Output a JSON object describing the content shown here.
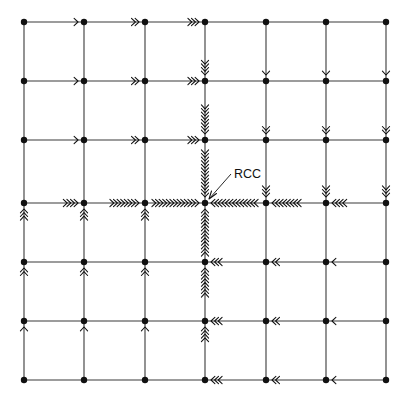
{
  "figure": {
    "title": "",
    "kind": "flow-net-diagram",
    "background_color": "#ffffff",
    "line_color": "#3a3a3a",
    "node_color": "#111111",
    "arrow_color": "#111111"
  },
  "labels": {
    "center_label": "RCC",
    "center_label_x": 234,
    "center_label_y": 178
  },
  "chart_data": {
    "type": "diagram",
    "title": "",
    "xlabel": "",
    "ylabel": "",
    "grid": {
      "columns": 7,
      "rows": 7,
      "x_positions": [
        24,
        84,
        145,
        205,
        266,
        326,
        386
      ],
      "y_positions": [
        22,
        81,
        140,
        203,
        262,
        321,
        380
      ],
      "cell_width": 60.3,
      "cell_height": 59.7,
      "node_radius": 3.2
    },
    "center_node": {
      "col": 3,
      "row": 3,
      "x": 205,
      "y": 203,
      "label": "RCC"
    },
    "horizontal_flows": [
      {
        "row": 0,
        "segment": 0,
        "direction": "right",
        "chevrons": 1
      },
      {
        "row": 0,
        "segment": 1,
        "direction": "right",
        "chevrons": 2
      },
      {
        "row": 0,
        "segment": 2,
        "direction": "right",
        "chevrons": 3
      },
      {
        "row": 1,
        "segment": 0,
        "direction": "right",
        "chevrons": 1
      },
      {
        "row": 1,
        "segment": 1,
        "direction": "right",
        "chevrons": 2
      },
      {
        "row": 1,
        "segment": 2,
        "direction": "right",
        "chevrons": 3
      },
      {
        "row": 2,
        "segment": 0,
        "direction": "right",
        "chevrons": 1
      },
      {
        "row": 2,
        "segment": 1,
        "direction": "right",
        "chevrons": 2
      },
      {
        "row": 2,
        "segment": 2,
        "direction": "right",
        "chevrons": 3
      },
      {
        "row": 3,
        "segment": 0,
        "direction": "right",
        "chevrons": 4
      },
      {
        "row": 3,
        "segment": 1,
        "direction": "right",
        "chevrons": 8
      },
      {
        "row": 3,
        "segment": 2,
        "direction": "right",
        "chevrons": 13
      },
      {
        "row": 3,
        "segment": 3,
        "direction": "left",
        "chevrons": 13
      },
      {
        "row": 3,
        "segment": 4,
        "direction": "left",
        "chevrons": 8
      },
      {
        "row": 3,
        "segment": 5,
        "direction": "left",
        "chevrons": 4
      },
      {
        "row": 4,
        "segment": 3,
        "direction": "left",
        "chevrons": 3
      },
      {
        "row": 4,
        "segment": 4,
        "direction": "left",
        "chevrons": 2
      },
      {
        "row": 4,
        "segment": 5,
        "direction": "left",
        "chevrons": 1
      },
      {
        "row": 5,
        "segment": 3,
        "direction": "left",
        "chevrons": 3
      },
      {
        "row": 5,
        "segment": 4,
        "direction": "left",
        "chevrons": 2
      },
      {
        "row": 5,
        "segment": 5,
        "direction": "left",
        "chevrons": 1
      },
      {
        "row": 6,
        "segment": 3,
        "direction": "left",
        "chevrons": 3
      },
      {
        "row": 6,
        "segment": 4,
        "direction": "left",
        "chevrons": 2
      },
      {
        "row": 6,
        "segment": 5,
        "direction": "left",
        "chevrons": 1
      }
    ],
    "vertical_flows": [
      {
        "col": 3,
        "segment": 0,
        "direction": "down",
        "chevrons": 4
      },
      {
        "col": 3,
        "segment": 1,
        "direction": "down",
        "chevrons": 8
      },
      {
        "col": 3,
        "segment": 2,
        "direction": "down",
        "chevrons": 13
      },
      {
        "col": 3,
        "segment": 3,
        "direction": "up",
        "chevrons": 13
      },
      {
        "col": 3,
        "segment": 4,
        "direction": "up",
        "chevrons": 8
      },
      {
        "col": 3,
        "segment": 5,
        "direction": "up",
        "chevrons": 4
      },
      {
        "col": 4,
        "segment": 0,
        "direction": "down",
        "chevrons": 1
      },
      {
        "col": 4,
        "segment": 1,
        "direction": "down",
        "chevrons": 2
      },
      {
        "col": 4,
        "segment": 2,
        "direction": "down",
        "chevrons": 3
      },
      {
        "col": 5,
        "segment": 0,
        "direction": "down",
        "chevrons": 1
      },
      {
        "col": 5,
        "segment": 1,
        "direction": "down",
        "chevrons": 2
      },
      {
        "col": 5,
        "segment": 2,
        "direction": "down",
        "chevrons": 3
      },
      {
        "col": 6,
        "segment": 0,
        "direction": "down",
        "chevrons": 1
      },
      {
        "col": 6,
        "segment": 1,
        "direction": "down",
        "chevrons": 2
      },
      {
        "col": 6,
        "segment": 2,
        "direction": "down",
        "chevrons": 3
      },
      {
        "col": 0,
        "segment": 3,
        "direction": "up",
        "chevrons": 3
      },
      {
        "col": 0,
        "segment": 4,
        "direction": "up",
        "chevrons": 2
      },
      {
        "col": 0,
        "segment": 5,
        "direction": "up",
        "chevrons": 1
      },
      {
        "col": 1,
        "segment": 3,
        "direction": "up",
        "chevrons": 3
      },
      {
        "col": 1,
        "segment": 4,
        "direction": "up",
        "chevrons": 2
      },
      {
        "col": 1,
        "segment": 5,
        "direction": "up",
        "chevrons": 1
      },
      {
        "col": 2,
        "segment": 3,
        "direction": "up",
        "chevrons": 3
      },
      {
        "col": 2,
        "segment": 4,
        "direction": "up",
        "chevrons": 2
      },
      {
        "col": 2,
        "segment": 5,
        "direction": "up",
        "chevrons": 1
      }
    ],
    "leader_line": {
      "x1": 231,
      "y1": 174,
      "x2": 209,
      "y2": 199
    }
  }
}
